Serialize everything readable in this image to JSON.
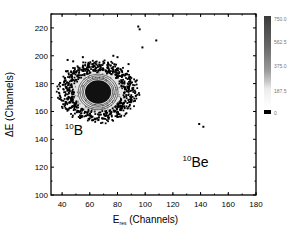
{
  "chart_data": {
    "type": "heatmap",
    "title": "",
    "xlabel": "E",
    "xlabel_sub": "res",
    "xlabel_suffix": " (Channels)",
    "ylabel": "ΔE (Channels)",
    "xlim": [
      32,
      180
    ],
    "ylim": [
      100,
      230
    ],
    "xticks": [
      40,
      60,
      80,
      100,
      120,
      140,
      160,
      180
    ],
    "yticks": [
      100,
      120,
      140,
      160,
      180,
      200,
      220
    ],
    "grid": false,
    "colorbar": {
      "ticks": [
        "750.0",
        "562.5",
        "375.0",
        "187.5",
        "0"
      ],
      "range": [
        0,
        750
      ],
      "position": "right"
    },
    "annotations": [
      {
        "text_sup": "10",
        "text": "B",
        "x": 42,
        "y": 143
      },
      {
        "text_sup": "10",
        "text": "Be",
        "x": 127,
        "y": 120
      }
    ],
    "clusters": [
      {
        "name": "10B",
        "center": [
          66,
          174
        ],
        "core_rx": 9,
        "core_ry": 8,
        "halo_rx": 26,
        "halo_ry": 20
      },
      {
        "name": "10Be",
        "points": [
          [
            139,
            151
          ],
          [
            142,
            149
          ]
        ]
      }
    ],
    "outliers": [
      [
        95,
        221
      ],
      [
        96,
        219
      ],
      [
        108,
        211
      ],
      [
        44,
        197
      ],
      [
        48,
        196
      ],
      [
        55,
        199
      ],
      [
        77,
        200
      ],
      [
        80,
        199
      ],
      [
        88,
        194
      ],
      [
        98,
        206
      ]
    ]
  }
}
